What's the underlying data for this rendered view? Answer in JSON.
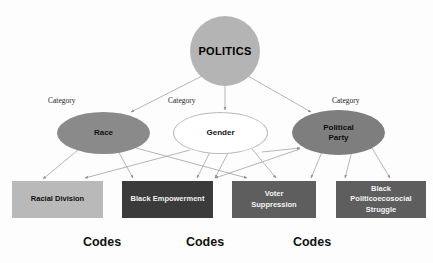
{
  "diagram": {
    "title_node": {
      "label": "POLITICS",
      "shape": "circle",
      "fill": "#b4b4b4"
    },
    "category_caption": "Category",
    "categories": [
      {
        "label": "Race",
        "caption": "Category",
        "shape": "ellipse",
        "fill": "#8a8a8a"
      },
      {
        "label": "Gender",
        "caption": "Category",
        "shape": "ellipse",
        "fill": "#ffffff"
      },
      {
        "label": "Political\nParty",
        "line1": "Political",
        "line2": "Party",
        "caption": "Category",
        "shape": "ellipse",
        "fill": "#7e7e7e"
      }
    ],
    "codes": [
      {
        "label": "Racial Division",
        "line1": "Racial Division",
        "line2": "",
        "fill": "#b9b9b9",
        "text_color": "#101010"
      },
      {
        "label": "Black Empowerment",
        "line1": "Black Empowerment",
        "line2": "",
        "fill": "#3b3b3b",
        "text_color": "#f2f2f2"
      },
      {
        "label": "Voter Suppression",
        "line1": "Voter",
        "line2": "Suppression",
        "fill": "#5e5e5e",
        "text_color": "#f4f4f4"
      },
      {
        "label": "Black Politicoecosocial Struggle",
        "line1": "Black Politicoecosocial",
        "line2": "Struggle",
        "fill": "#5e5e5e",
        "text_color": "#f4f4f4"
      }
    ],
    "codes_labels": [
      "Codes",
      "Codes",
      "Codes"
    ],
    "connector_color": "#9a9a9a"
  }
}
